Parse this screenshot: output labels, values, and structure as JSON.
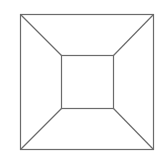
{
  "diagram": {
    "stroke_color": "#6b6b6b",
    "outer_square": {
      "x1": 20,
      "y1": 14,
      "x2": 153,
      "y2": 149
    },
    "inner_square": {
      "x1": 61,
      "y1": 55,
      "x2": 113,
      "y2": 108
    },
    "connectors": [
      {
        "from": [
          20,
          14
        ],
        "to": [
          61,
          55
        ]
      },
      {
        "from": [
          153,
          14
        ],
        "to": [
          113,
          55
        ]
      },
      {
        "from": [
          20,
          149
        ],
        "to": [
          61,
          108
        ]
      },
      {
        "from": [
          153,
          149
        ],
        "to": [
          113,
          108
        ]
      }
    ]
  }
}
